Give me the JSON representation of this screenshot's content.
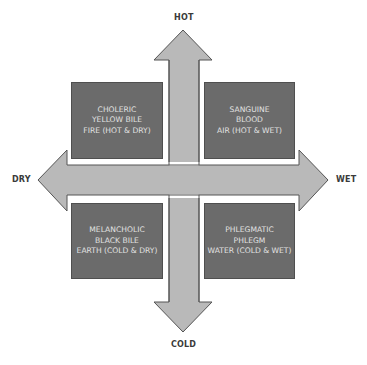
{
  "diagram": {
    "type": "four-humors-quadrant",
    "colors": {
      "arrow_fill": "#b9b9b9",
      "arrow_stroke": "#555555",
      "box_fill": "#6b6b6b",
      "box_text": "#e2e2e2",
      "label_text": "#3a3a3a",
      "background": "#ffffff"
    },
    "axes": {
      "top": "HOT",
      "bottom": "COLD",
      "left": "DRY",
      "right": "WET"
    },
    "quadrants": [
      {
        "position": "top-left",
        "temperament": "CHOLERIC",
        "humor": "YELLOW BILE",
        "element": "FIRE (HOT & DRY)"
      },
      {
        "position": "top-right",
        "temperament": "SANGUINE",
        "humor": "BLOOD",
        "element": "AIR (HOT & WET)"
      },
      {
        "position": "bottom-left",
        "temperament": "MELANCHOLIC",
        "humor": "BLACK BILE",
        "element": "EARTH (COLD & DRY)"
      },
      {
        "position": "bottom-right",
        "temperament": "PHLEGMATIC",
        "humor": "PHLEGM",
        "element": "WATER (COLD & WET)"
      }
    ]
  }
}
